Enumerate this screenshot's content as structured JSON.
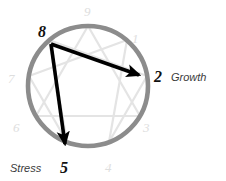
{
  "figure": {
    "name": "enneagram-arrows-diagram",
    "type": "diagram",
    "background_color": "#ffffff",
    "width": 226,
    "height": 181
  },
  "circle": {
    "center_x": 88,
    "center_y": 86,
    "radius": 60,
    "stroke_color": "#8c8c8c",
    "stroke_width": 4.5
  },
  "inner_lines": {
    "stroke_color": "#e2e2e2",
    "stroke_width": 2.2,
    "hexad_sequence": [
      1,
      4,
      2,
      8,
      5,
      7
    ],
    "triangle_sequence": [
      9,
      3,
      6
    ]
  },
  "points": [
    {
      "number": "9",
      "angle_deg": 90,
      "x": 88,
      "y": 26,
      "faint": true
    },
    {
      "number": "1",
      "angle_deg": 50,
      "x": 127,
      "y": 40,
      "faint": true
    },
    {
      "number": "2",
      "angle_deg": 10,
      "x": 147,
      "y": 76,
      "faint": false
    },
    {
      "number": "3",
      "angle_deg": -30,
      "x": 140,
      "y": 116,
      "faint": true
    },
    {
      "number": "4",
      "angle_deg": -70,
      "x": 109,
      "y": 142,
      "faint": true
    },
    {
      "number": "5",
      "angle_deg": -110,
      "x": 67,
      "y": 142,
      "faint": false
    },
    {
      "number": "6",
      "angle_deg": -150,
      "x": 36,
      "y": 116,
      "faint": true
    },
    {
      "number": "7",
      "angle_deg": 170,
      "x": 29,
      "y": 76,
      "faint": true
    },
    {
      "number": "8",
      "angle_deg": 130,
      "x": 49,
      "y": 40,
      "faint": false
    }
  ],
  "faint_numbers": {
    "color": "#dcdcdc",
    "font_size": 13,
    "items": [
      {
        "label": "9",
        "x": 84,
        "y": 4
      },
      {
        "label": "1",
        "x": 133,
        "y": 30
      },
      {
        "label": "3",
        "x": 144,
        "y": 120
      },
      {
        "label": "4",
        "x": 106,
        "y": 160
      },
      {
        "label": "6",
        "x": 14,
        "y": 120
      },
      {
        "label": "7",
        "x": 9,
        "y": 70
      }
    ]
  },
  "arrows": {
    "stroke_color": "#000000",
    "stroke_width": 3.6,
    "items": [
      {
        "name": "growth-arrow",
        "from_point": "8",
        "to_point": "2",
        "from_x": 51,
        "from_y": 44,
        "to_x": 143,
        "to_y": 77,
        "meaning": "Growth"
      },
      {
        "name": "stress-arrow",
        "from_point": "8",
        "to_point": "5",
        "from_x": 51,
        "from_y": 44,
        "to_x": 66,
        "to_y": 149,
        "meaning": "Stress"
      }
    ]
  },
  "labels": {
    "origin_number": "8",
    "growth_number": "2",
    "growth_word": "Growth",
    "stress_number": "5",
    "stress_word": "Stress"
  }
}
